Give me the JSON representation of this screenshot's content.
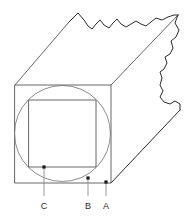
{
  "figure": {
    "canvas": {
      "width": 192,
      "height": 219,
      "background": "#ffffff"
    },
    "colors": {
      "outline_dark": "#2b2b2b",
      "outline_mid": "#555555",
      "outline_light": "#777777",
      "leader_line": "#8a8a8a",
      "marker_dot": "#1a1a1a",
      "label_text": "#2b2b2b"
    },
    "shapes": {
      "outer_square": {
        "name": "outer-square",
        "points": "15,85 111,85 111,183 15,183",
        "description": "front face square of the prism"
      },
      "inscribed_circle": {
        "name": "inscribed-circle",
        "cx": 62.5,
        "cy": 133.5,
        "r": 48,
        "description": "circle inscribed in the outer square"
      },
      "inner_square": {
        "name": "inner-square",
        "points": "29,100 96,100 96,167 29,167",
        "description": "square inscribed in the circle"
      },
      "top_back_edge": {
        "name": "top-back-edge",
        "points": "15,85 69,22"
      },
      "right_back_edge": {
        "name": "right-back-edge",
        "points": "111,85 178,15"
      },
      "bottom_right_edge": {
        "name": "bottom-right-edge",
        "points": "111,183 180,110"
      },
      "torn_top_edge": {
        "name": "torn-top-edge",
        "path": "M69,22 L78,13 L84,20 L88,26 L92,29 L96,24 L100,20 L104,25 L109,28 L113,23 L117,19 L121,24 L126,27 L131,24 L136,21 L141,24 L146,26 L151,22 L156,18 L162,20 L168,17 L174,15 L178,15",
        "description": "jagged torn top edge of the broken prism"
      },
      "torn_right_edge": {
        "name": "torn-right-edge",
        "path": "M178,15 L175,23 L179,30 L176,37 L171,41 L173,48 L170,54 L165,57 L167,63 L164,69 L160,72 L162,78 L160,85 L163,91 L160,97 L164,102 L170,104 L175,101 L180,104 L180,110",
        "description": "jagged torn right edge of the broken prism"
      }
    },
    "markers": [
      {
        "id": "C",
        "label": "C",
        "point_x": 44,
        "point_y": 167,
        "leader_to_y": 196,
        "label_x": 44,
        "label_y": 209,
        "description": "bottom-left corner of the inner square"
      },
      {
        "id": "B",
        "label": "B",
        "point_x": 88,
        "point_y": 178,
        "leader_to_y": 196,
        "label_x": 88,
        "label_y": 209,
        "description": "point on the inscribed circle"
      },
      {
        "id": "A",
        "label": "A",
        "point_x": 106,
        "point_y": 182,
        "leader_to_y": 196,
        "label_x": 106,
        "label_y": 209,
        "description": "bottom-right corner of the outer square"
      }
    ]
  }
}
